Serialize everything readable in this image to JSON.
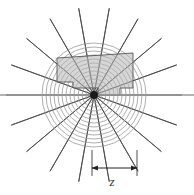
{
  "figure": {
    "name": "polar-radial-diagram",
    "width": 194,
    "height": 195,
    "background_color": "#ffffff"
  },
  "geometry": {
    "center": {
      "x": 94,
      "y": 95
    },
    "circles": {
      "count": 13,
      "radii": [
        4,
        8,
        12,
        16,
        20,
        24,
        28,
        32,
        36,
        40,
        44,
        48,
        52
      ],
      "stroke_color": "#9a9a9a",
      "stroke_width": 0.8
    },
    "spokes": {
      "count": 18,
      "angles_deg": [
        0,
        20,
        40,
        60,
        80,
        100,
        120,
        140,
        160,
        180,
        200,
        220,
        240,
        260,
        280,
        300,
        320,
        340
      ],
      "length": 88,
      "stroke_color": "#4a4a4a",
      "stroke_width": 0.9
    },
    "hub": {
      "radius": 4,
      "fill_color": "#1a1a1a"
    },
    "axis_line": {
      "y": 95,
      "x_start": 0,
      "x_end": 194,
      "stroke_color": "#9a9a9a",
      "stroke_width": 1.6
    },
    "shaded_region": {
      "fill_color": "#b5b5b5",
      "fill_opacity": 0.55,
      "stroke_color": "#555555",
      "stroke_width": 0.9,
      "points": "57,58 133,53 133,88 120,88 120,95 98,95 98,88 73,88 73,82 57,82"
    }
  },
  "annotation": {
    "dimension_line": {
      "y": 168,
      "x_start": 92,
      "x_end": 137,
      "stroke_color": "#222222",
      "stroke_width": 1.0,
      "arrowheads": "both"
    },
    "extension_ticks": [
      {
        "x": 92,
        "y_top": 150,
        "y_bottom": 176
      },
      {
        "x": 137,
        "y_top": 150,
        "y_bottom": 176
      }
    ],
    "label": {
      "text": "z",
      "x": 112,
      "y": 186,
      "style": "italic",
      "color": "#333333"
    }
  }
}
